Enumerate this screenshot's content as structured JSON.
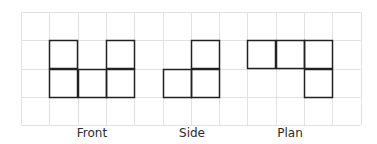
{
  "diagram": {
    "grid": {
      "x0": 21,
      "y0": 12,
      "cell": 28.3,
      "cols": 12,
      "rows": 4,
      "line_color": "#e2e2e2",
      "outline_color": "#222222"
    },
    "views": [
      {
        "label": "Front",
        "label_x": 92,
        "cells": [
          [
            1,
            1
          ],
          [
            3,
            1
          ],
          [
            1,
            2
          ],
          [
            2,
            2
          ],
          [
            3,
            2
          ]
        ]
      },
      {
        "label": "Side",
        "label_x": 192,
        "cells": [
          [
            6,
            1
          ],
          [
            5,
            2
          ],
          [
            6,
            2
          ]
        ]
      },
      {
        "label": "Plan",
        "label_x": 290,
        "cells": [
          [
            8,
            1
          ],
          [
            9,
            1
          ],
          [
            10,
            1
          ],
          [
            10,
            2
          ]
        ]
      }
    ]
  }
}
